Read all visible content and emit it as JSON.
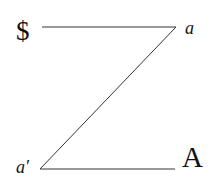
{
  "diagram": {
    "name": "Schema L (Z-schema)",
    "nodes": {
      "subject": {
        "label": "$"
      },
      "other_small": {
        "label": "a"
      },
      "ego": {
        "label": "a′"
      },
      "other_big": {
        "label": "A"
      }
    },
    "edges": [
      {
        "from": "subject",
        "to": "other_small"
      },
      {
        "from": "other_small",
        "to": "ego"
      },
      {
        "from": "ego",
        "to": "other_big"
      }
    ],
    "colors": {
      "line": "#333333",
      "text": "#111111",
      "background": "#ffffff"
    }
  }
}
